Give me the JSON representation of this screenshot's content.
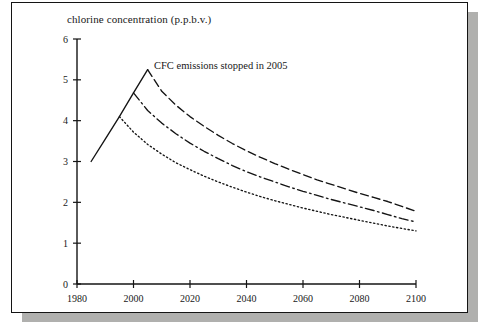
{
  "figure": {
    "title": "chlorine concentration (p.p.b.v.)",
    "annotation": "CFC emissions stopped in 2005"
  },
  "chart_data": {
    "type": "line",
    "title": "chlorine concentration (p.p.b.v.)",
    "xlabel": "",
    "ylabel": "chlorine concentration (p.p.b.v.)",
    "xlim": [
      1980,
      2100
    ],
    "ylim": [
      0,
      6
    ],
    "xticks": [
      1980,
      2000,
      2020,
      2040,
      2060,
      2080,
      2100
    ],
    "yticks": [
      0,
      1,
      2,
      3,
      4,
      5,
      6
    ],
    "grid": false,
    "legend": false,
    "annotations": [
      {
        "text": "CFC emissions stopped in 2005",
        "x": 2007,
        "y": 5.25
      }
    ],
    "series": [
      {
        "name": "historical rise (observed)",
        "style": "solid",
        "x": [
          1985,
          1990,
          1995,
          2000,
          2005
        ],
        "y": [
          3.0,
          3.55,
          4.1,
          4.68,
          5.25
        ]
      },
      {
        "name": "CFC emissions stopped in 2005",
        "style": "dashed",
        "x": [
          2005,
          2010,
          2015,
          2020,
          2025,
          2030,
          2035,
          2040,
          2045,
          2050,
          2055,
          2060,
          2065,
          2070,
          2075,
          2080,
          2085,
          2090,
          2095,
          2100
        ],
        "y": [
          5.25,
          4.72,
          4.38,
          4.1,
          3.86,
          3.64,
          3.44,
          3.26,
          3.1,
          2.95,
          2.81,
          2.68,
          2.55,
          2.44,
          2.33,
          2.22,
          2.12,
          2.02,
          1.9,
          1.78
        ]
      },
      {
        "name": "CFC emissions stopped in 2000",
        "style": "dash-dot",
        "x": [
          2000,
          2005,
          2010,
          2015,
          2020,
          2025,
          2030,
          2035,
          2040,
          2045,
          2050,
          2055,
          2060,
          2065,
          2070,
          2075,
          2080,
          2085,
          2090,
          2095,
          2100
        ],
        "y": [
          4.68,
          4.25,
          3.94,
          3.68,
          3.45,
          3.25,
          3.07,
          2.9,
          2.75,
          2.62,
          2.5,
          2.38,
          2.27,
          2.17,
          2.07,
          1.98,
          1.89,
          1.8,
          1.7,
          1.6,
          1.52
        ]
      },
      {
        "name": "CFC emissions stopped in 1995",
        "style": "dotted",
        "x": [
          1995,
          2000,
          2005,
          2010,
          2015,
          2020,
          2025,
          2030,
          2035,
          2040,
          2045,
          2050,
          2055,
          2060,
          2065,
          2070,
          2075,
          2080,
          2085,
          2090,
          2095,
          2100
        ],
        "y": [
          4.1,
          3.72,
          3.42,
          3.18,
          2.97,
          2.8,
          2.64,
          2.5,
          2.37,
          2.25,
          2.14,
          2.04,
          1.95,
          1.86,
          1.78,
          1.7,
          1.63,
          1.56,
          1.49,
          1.42,
          1.36,
          1.3
        ]
      }
    ]
  }
}
